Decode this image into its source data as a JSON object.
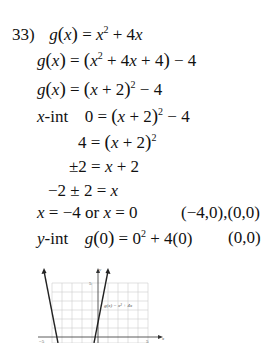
{
  "problem": {
    "number": "33)",
    "lines": [
      {
        "id": "l1",
        "text": "g(x) = x^2 + 4x"
      },
      {
        "id": "l2",
        "text": "g(x) = (x^2 + 4x + 4) - 4"
      },
      {
        "id": "l3",
        "text": "g(x) = (x + 2)^2 - 4"
      },
      {
        "id": "l4",
        "label": "x-int",
        "text": "0 = (x + 2)^2 - 4"
      },
      {
        "id": "l5",
        "text": "4 = (x + 2)^2"
      },
      {
        "id": "l6",
        "text": "±2 = x + 2"
      },
      {
        "id": "l7",
        "text": "-2 ± 2 = x"
      },
      {
        "id": "l8",
        "text": "x = -4 or x = 0",
        "result": "(-4,0),(0,0)"
      },
      {
        "id": "l9",
        "label": "y-int",
        "text": "g(0) = 0^2 + 4(0)",
        "result": "(0,0)"
      }
    ],
    "t": {
      "n33": "33)",
      "g": "g",
      "x": "x",
      "y": "y",
      "eq": "=",
      "plus": "+",
      "minus": "−",
      "pm": "±",
      "two": "2",
      "four": "4",
      "zero": "0",
      "fourx": "4x",
      "neg4": "−4",
      "neg2": "−2",
      "or": "or",
      "xint_label": "-int",
      "yint_label": "-int",
      "result_xint": "(−4,0),(0,0)",
      "result_yint": "(0,0)",
      "four_paren_zero": "4(0)"
    }
  },
  "graph": {
    "function_label": "g(x) = x² + 4x",
    "x_axis_label": "x",
    "y_axis_label": "y",
    "tick_neg5": "−5",
    "tick_5_x": "5",
    "tick_5_y": "5",
    "x_intercepts": [
      -4,
      0
    ],
    "vertex": [
      -2,
      -4
    ]
  }
}
